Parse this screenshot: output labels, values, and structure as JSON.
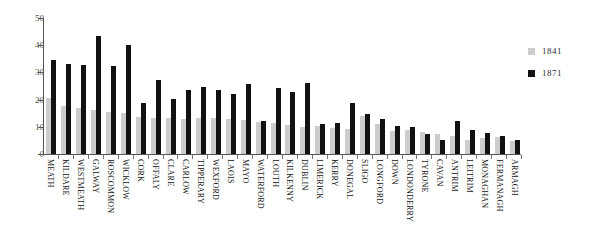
{
  "chart_data": {
    "type": "bar",
    "title": "",
    "subtitle": "",
    "xlabel": "",
    "ylabel": "",
    "ylim": [
      0,
      50
    ],
    "yticks": [
      0,
      10,
      20,
      30,
      40,
      50
    ],
    "grid": false,
    "legend_position": "right",
    "categories": [
      "MEATH",
      "KILDARE",
      "WESTMEATH",
      "GALWAY",
      "ROSCOMMON",
      "WICKLOW",
      "CORK",
      "OFFALY",
      "CLARE",
      "CARLOW",
      "TIPPERARY",
      "WEXFORD",
      "LAOIS",
      "MAYO",
      "WATERFORD",
      "LOUTH",
      "KILKENNY",
      "DUBLIN",
      "LIMERICK",
      "KERRY",
      "DONEGAL",
      "SLIGO",
      "LONGFORD",
      "DOWN",
      "LONDONDERRY",
      "TYRONE",
      "CAVAN",
      "ANTRIM",
      "LEITRIM",
      "MONAGHAN",
      "FERMANAGH",
      "ARMAGH"
    ],
    "series": [
      {
        "name": "1841",
        "color": "#cccccc",
        "values": [
          20.5,
          17.8,
          17.0,
          16.2,
          15.3,
          15.0,
          13.6,
          13.4,
          13.4,
          12.7,
          13.2,
          13.4,
          12.8,
          12.4,
          11.7,
          11.3,
          10.6,
          9.8,
          10.3,
          9.4,
          9.1,
          13.8,
          10.9,
          8.5,
          9.0,
          8.0,
          7.2,
          6.8,
          5.3,
          6.0,
          6.3,
          4.7
        ]
      },
      {
        "name": "1871",
        "color": "#111111",
        "values": [
          34.6,
          33.1,
          32.8,
          43.4,
          32.2,
          40.0,
          18.6,
          27.2,
          20.3,
          23.4,
          24.5,
          23.5,
          22.0,
          25.6,
          12.3,
          24.2,
          22.8,
          26.2,
          10.9,
          11.5,
          18.6,
          14.8,
          12.8,
          10.2,
          9.8,
          7.2,
          5.3,
          12.0,
          8.7,
          7.7,
          6.6,
          5.3
        ]
      }
    ]
  },
  "legend": {
    "entries": [
      {
        "label": "1841",
        "color": "#cccccc"
      },
      {
        "label": "1871",
        "color": "#111111"
      }
    ]
  },
  "axis": {
    "y_tick_labels": [
      "50",
      "40",
      "30",
      "20",
      "10",
      "0"
    ]
  },
  "colors": {
    "series_1841": "#cccccc",
    "series_1871": "#111111",
    "axis": "#555555",
    "text": "#333333",
    "background": "#ffffff"
  }
}
